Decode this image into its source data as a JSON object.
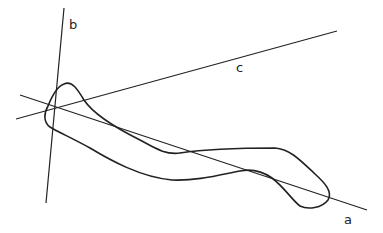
{
  "diagram": {
    "labels": {
      "a": "a",
      "b": "b",
      "c": "c"
    },
    "lines": [
      {
        "name": "a",
        "x1": 20,
        "y1": 95,
        "x2": 367,
        "y2": 210
      },
      {
        "name": "b",
        "x1": 64,
        "y1": 8,
        "x2": 46,
        "y2": 203
      },
      {
        "name": "c",
        "x1": 16,
        "y1": 119,
        "x2": 337,
        "y2": 31
      }
    ],
    "stroke_color": "#222222",
    "background": "#ffffff"
  }
}
